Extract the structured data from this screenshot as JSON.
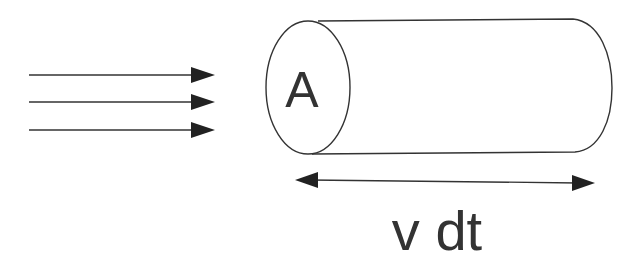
{
  "diagram": {
    "type": "flux-cylinder",
    "colors": {
      "stroke": "#333333",
      "text": "#333333",
      "background": "#ffffff"
    },
    "incoming_arrows": {
      "count": 3,
      "direction": "right",
      "y_positions": [
        75,
        102,
        130
      ]
    },
    "cylinder": {
      "cross_section_label": "A"
    },
    "length_arrow": {
      "type": "double-headed",
      "label": "v dt"
    }
  }
}
